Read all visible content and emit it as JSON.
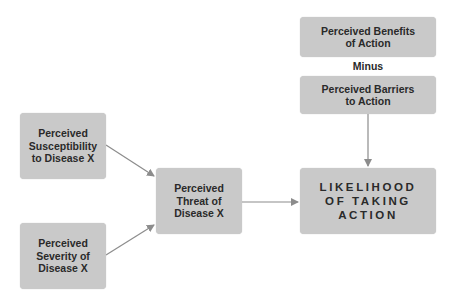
{
  "diagram": {
    "nodes": {
      "susceptibility": "Perceived\nSusceptibility\nto Disease X",
      "severity": "Perceived\nSeverity of\nDisease X",
      "threat": "Perceived\nThreat of\nDisease X",
      "likelihood": "LIKELIHOOD\nOF TAKING\nACTION",
      "benefits": "Perceived Benefits\nof Action",
      "barriers": "Perceived Barriers\nto Action"
    },
    "minus_label": "Minus",
    "edges": [
      {
        "from": "susceptibility",
        "to": "threat"
      },
      {
        "from": "severity",
        "to": "threat"
      },
      {
        "from": "threat",
        "to": "likelihood"
      },
      {
        "from": "barriers",
        "to": "likelihood"
      }
    ],
    "colors": {
      "box": "#c9c9c9",
      "arrow": "#8c8c8c",
      "text": "#2a2a2a"
    }
  }
}
